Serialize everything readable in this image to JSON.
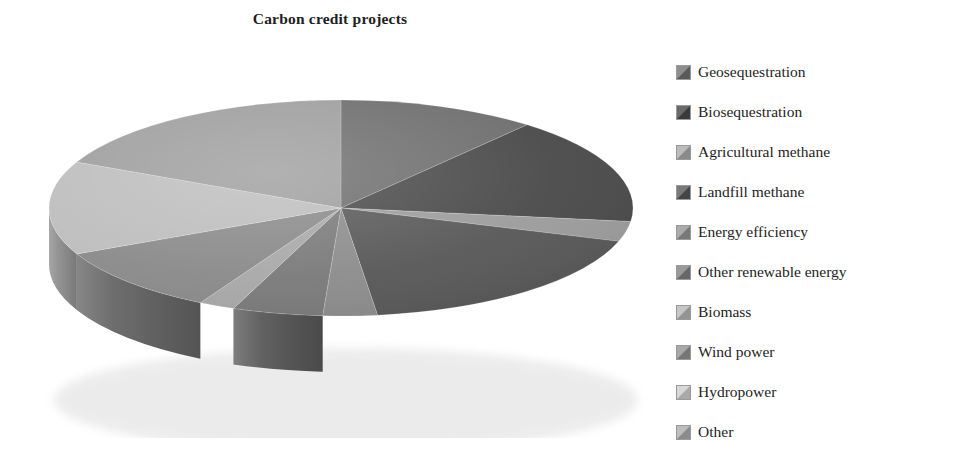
{
  "title": "Carbon credit projects",
  "legend": {
    "position": "right",
    "items": [
      {
        "label": "Geosequestration",
        "color": "#6e6e6e",
        "swatch_light": "#8f8f8f",
        "swatch_dark": "#5a5a5a"
      },
      {
        "label": "Biosequestration",
        "color": "#4a4a4a",
        "swatch_light": "#6a6a6a",
        "swatch_dark": "#3a3a3a"
      },
      {
        "label": "Agricultural methane",
        "color": "#9c9c9c",
        "swatch_light": "#bcbcbc",
        "swatch_dark": "#8a8a8a"
      },
      {
        "label": "Landfill methane",
        "color": "#585858",
        "swatch_light": "#7a7a7a",
        "swatch_dark": "#454545"
      },
      {
        "label": "Energy efficiency",
        "color": "#8c8c8c",
        "swatch_light": "#ababab",
        "swatch_dark": "#787878"
      },
      {
        "label": "Other renewable energy",
        "color": "#7a7a7a",
        "swatch_light": "#9a9a9a",
        "swatch_dark": "#676767"
      },
      {
        "label": "Biomass",
        "color": "#a8a8a8",
        "swatch_light": "#c6c6c6",
        "swatch_dark": "#949494"
      },
      {
        "label": "Wind power",
        "color": "#8a8a8a",
        "swatch_light": "#a8a8a8",
        "swatch_dark": "#767676"
      },
      {
        "label": "Hydropower",
        "color": "#bdbdbd",
        "swatch_light": "#d8d8d8",
        "swatch_dark": "#a9a9a9"
      },
      {
        "label": "Other",
        "color": "#9e9e9e",
        "swatch_light": "#bdbdbd",
        "swatch_dark": "#8b8b8b"
      }
    ]
  },
  "chart_data": {
    "type": "pie",
    "title": "Carbon credit projects",
    "three_d": true,
    "start_angle": 0,
    "direction": "clockwise",
    "grid": false,
    "legend_position": "right",
    "categories": [
      "Geosequestration",
      "Biosequestration",
      "Agricultural methane",
      "Landfill methane",
      "Energy efficiency",
      "Other renewable energy",
      "Biomass",
      "Wind power",
      "Hydropower",
      "Other"
    ],
    "values": [
      11,
      16,
      3,
      18,
      3,
      5,
      2,
      10,
      14,
      18
    ],
    "unit": "percent",
    "colors": [
      "#6e6e6e",
      "#4a4a4a",
      "#9c9c9c",
      "#585858",
      "#8c8c8c",
      "#7a7a7a",
      "#a8a8a8",
      "#8a8a8a",
      "#bdbdbd",
      "#9e9e9e"
    ],
    "slice_side_colors": [
      "#4f4f4f",
      "#343434",
      "#737373",
      "#3f3f3f",
      "#666666",
      "#585858",
      "#7d7d7d",
      "#646464",
      "#8e8e8e",
      "#747474"
    ],
    "xlabel": "",
    "ylabel": ""
  }
}
